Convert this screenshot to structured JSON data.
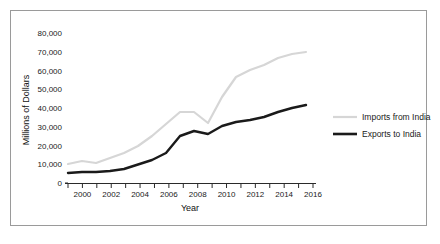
{
  "chart_data": {
    "type": "line",
    "title": "",
    "xlabel": "Year",
    "ylabel": "Millions of Dollars",
    "xlim": [
      1999,
      2016
    ],
    "ylim": [
      0,
      80000
    ],
    "grid": false,
    "legend_position": "right",
    "y_ticks": [
      0,
      10000,
      20000,
      30000,
      40000,
      50000,
      60000,
      70000,
      80000
    ],
    "y_tick_labels": [
      "0",
      "10,000",
      "20,000",
      "30,000",
      "40,000",
      "50,000",
      "60,000",
      "70,000",
      "80,000"
    ],
    "x_ticks": [
      1999,
      2000,
      2001,
      2002,
      2003,
      2004,
      2005,
      2006,
      2007,
      2008,
      2009,
      2010,
      2011,
      2012,
      2013,
      2014,
      2015,
      2016
    ],
    "x_tick_labels_shown": [
      "2000",
      "2002",
      "2004",
      "2006",
      "2008",
      "2010",
      "2012",
      "2014",
      "2016"
    ],
    "x": [
      1999,
      2000,
      2001,
      2002,
      2003,
      2004,
      2005,
      2006,
      2007,
      2008,
      2009,
      2010,
      2011,
      2012,
      2013,
      2014,
      2015,
      2016
    ],
    "series": [
      {
        "name": "Imports from India",
        "color": "#d6d6d6",
        "width": 2.2,
        "values": [
          9100,
          10700,
          9700,
          11800,
          13000,
          15500,
          18800,
          21800,
          24000,
          25700,
          21200,
          29500,
          36200,
          40500,
          41800,
          45200,
          44800,
          46000
        ]
      },
      {
        "name": "Exports to India",
        "color": "#1a1a1a",
        "width": 2.4,
        "values": [
          3700,
          3600,
          3800,
          4100,
          5000,
          6100,
          7900,
          10100,
          17600,
          18600,
          16400,
          19200,
          21500,
          22300,
          21800,
          21600,
          21500,
          21700
        ]
      }
    ],
    "legend": [
      {
        "label": "Imports from India",
        "color": "#d6d6d6"
      },
      {
        "label": "Exports to India",
        "color": "#1a1a1a"
      }
    ]
  },
  "plot_geometry": {
    "note": "pixel coordinates used for rendering",
    "x0": 68,
    "x1": 313,
    "y0": 183,
    "y1": 33,
    "imports_px": [
      [
        68,
        164
      ],
      [
        82,
        161
      ],
      [
        96,
        163
      ],
      [
        110,
        158
      ],
      [
        124,
        153
      ],
      [
        138,
        146
      ],
      [
        152,
        136
      ],
      [
        166,
        124
      ],
      [
        180,
        112
      ],
      [
        194,
        112
      ],
      [
        208,
        123
      ],
      [
        222,
        97
      ],
      [
        236,
        77
      ],
      [
        250,
        70
      ],
      [
        264,
        65
      ],
      [
        278,
        58
      ],
      [
        292,
        54
      ],
      [
        306,
        52
      ]
    ],
    "exports_px": [
      [
        68,
        173
      ],
      [
        82,
        172
      ],
      [
        96,
        172
      ],
      [
        110,
        171
      ],
      [
        124,
        169
      ],
      [
        124,
        169
      ],
      [
        152,
        160
      ],
      [
        166,
        153
      ],
      [
        180,
        136
      ],
      [
        194,
        131
      ],
      [
        208,
        134
      ],
      [
        222,
        126
      ],
      [
        236,
        122
      ],
      [
        250,
        120
      ],
      [
        264,
        117
      ],
      [
        278,
        112
      ],
      [
        292,
        108
      ],
      [
        306,
        105
      ]
    ]
  },
  "axis_labels": {
    "y_title": "Millions of Dollars",
    "x_title": "Year"
  }
}
